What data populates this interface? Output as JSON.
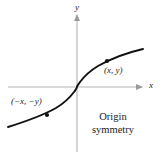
{
  "figure": {
    "background_color": "#ffffff",
    "axis_color": "#b3b3b3",
    "curve_color": "#111111",
    "text_color": "#1a1a1a",
    "axes": {
      "x_label": "x",
      "y_label": "y",
      "x_axis": {
        "x1": 8,
        "y1": 87,
        "x2": 145,
        "y2": 87,
        "arrow": "right"
      },
      "y_axis": {
        "x1": 77,
        "y1": 152,
        "x2": 77,
        "y2": 12,
        "arrow": "up"
      }
    },
    "caption": {
      "line1": "Origin",
      "line2": "symmetry"
    },
    "points": [
      {
        "name": "point-positive",
        "label": "(x, y)",
        "cx": 107,
        "cy": 61,
        "r": 2.1
      },
      {
        "name": "point-negative",
        "label": "(−x, −y)",
        "cx": 47,
        "cy": 115,
        "r": 2.1
      }
    ]
  },
  "chart_data": {
    "type": "line",
    "title": "Origin symmetry",
    "xlabel": "x",
    "ylabel": "y",
    "grid": false,
    "legend": null,
    "annotations": [
      "(x, y)",
      "(−x, −y)",
      "Origin",
      "symmetry"
    ],
    "curve_path": "M 8,127 C 24,122 40,117 56,108 C 66,102 71,96 74,92 C 76,89 77,88 77,87 C 77,86 78,85 80,82 C 83,78 88,72 98,66 C 114,57 130,52 143,49",
    "xlim": [
      8,
      145
    ],
    "ylim": [
      152,
      12
    ]
  }
}
